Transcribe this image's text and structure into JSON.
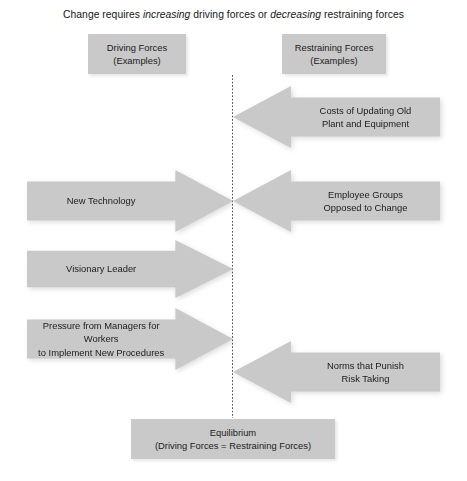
{
  "title": {
    "prefix": "Change requires ",
    "em1": "increasing",
    "middle": " driving forces or ",
    "em2": "decreasing",
    "suffix": " restraining forces"
  },
  "headers": {
    "driving": "Driving Forces\n(Examples)",
    "restraining": "Restraining Forces\n(Examples)"
  },
  "driving_forces": [
    {
      "label": "New Technology"
    },
    {
      "label": "Visionary Leader"
    },
    {
      "label": "Pressure from Managers for Workers\nto Implement New Procedures"
    }
  ],
  "restraining_forces": [
    {
      "label": "Costs of Updating Old\nPlant and Equipment"
    },
    {
      "label": "Employee Groups\nOpposed to Change"
    },
    {
      "label": "Norms that Punish\nRisk Taking"
    }
  ],
  "equilibrium": "Equilibrium\n(Driving Forces = Restraining Forces)",
  "colors": {
    "shape_fill": "#c9c9c9",
    "text": "#1b1b1b",
    "divider": "#555555",
    "background": "#ffffff"
  }
}
